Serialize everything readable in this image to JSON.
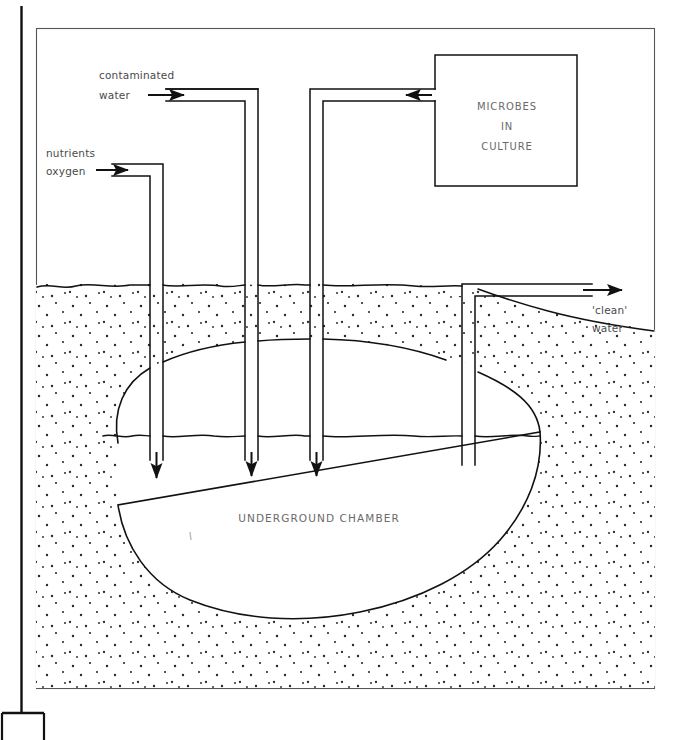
{
  "page": {
    "background_color": "#ffffff",
    "ink_color": "#1a1a1a",
    "text_color": "#4a4a4a",
    "width": 680,
    "height": 740
  },
  "margin_rule": {
    "name": "left-margin-rule",
    "description": "vertical page margin line with T-foot at bottom"
  },
  "frame": {
    "name": "diagram-frame",
    "description": "thin rectangular border enclosing the diagram"
  },
  "labels": {
    "contaminated_water": "contaminated\nwater",
    "contaminated_water_line1": "contaminated",
    "contaminated_water_line2": "water",
    "nutrients": "nutrients",
    "oxygen": "oxygen",
    "clean_water_line1": "'clean'",
    "clean_water_line2": "water",
    "microbes_line1": "MICROBES",
    "microbes_line2": "IN",
    "microbes_line3": "CULTURE",
    "underground_chamber": "UNDERGROUND CHAMBER"
  },
  "components": {
    "microbes_box": {
      "name": "microbes-in-culture-box",
      "text": "MICROBES IN CULTURE",
      "inlet_side": "left"
    },
    "pipes": [
      {
        "name": "contaminated-water-pipe-1",
        "direction": "down",
        "arrow": true
      },
      {
        "name": "contaminated-water-pipe-2",
        "direction": "down",
        "arrow": true
      },
      {
        "name": "nutrients-oxygen-pipe",
        "direction": "down",
        "arrow": true
      },
      {
        "name": "microbes-feed-pipe",
        "direction": "down",
        "arrow": true
      },
      {
        "name": "clean-water-outlet-pipe",
        "direction": "up-right",
        "arrow": true
      }
    ],
    "soil": {
      "name": "soil-stipple",
      "fill": "stippled dots"
    },
    "ground_surface": {
      "name": "ground-surface-line"
    },
    "water_table": {
      "name": "water-table-line"
    },
    "chamber": {
      "name": "underground-chamber-outline"
    }
  },
  "arrows": {
    "contaminated_water_in": "right",
    "nutrients_oxygen_in": "right",
    "microbes_in": "left",
    "clean_water_out": "right",
    "downflow": "down"
  }
}
